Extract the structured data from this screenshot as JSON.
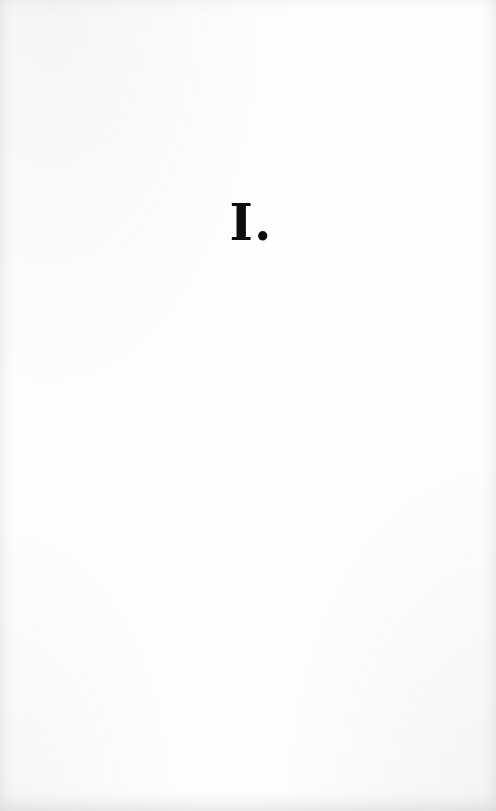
{
  "page": {
    "chapter_heading": "I."
  },
  "colors": {
    "paper": "#fefefe",
    "ink": "#0d0d0d"
  }
}
